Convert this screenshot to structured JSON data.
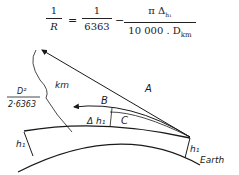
{
  "formula": {
    "lhs_num": "1",
    "lhs_den": "R",
    "equals": "=",
    "term1_num": "1",
    "term1_den": "6363",
    "minus": "−",
    "term2_num": "π Δ",
    "term2_num_sub": "h₁",
    "term2_den": "10 000 . D",
    "term2_den_sub": "km"
  },
  "diagram": {
    "labels": {
      "A": "A",
      "B": "B",
      "C": "C",
      "delta_h": "Δ h₁",
      "km": "km",
      "d_num": "D²",
      "d_den": "2·6363",
      "h_left": "h₁",
      "h_right": "h₁",
      "earth": "Earth"
    },
    "colors": {
      "line": "#1a1a1a",
      "background": "#ffffff"
    }
  }
}
